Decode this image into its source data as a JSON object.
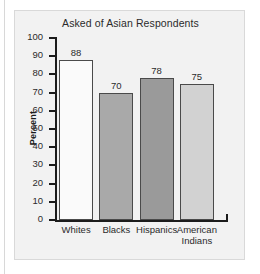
{
  "chart_data": {
    "type": "bar",
    "title": "Asked of Asian Respondents",
    "xlabel": "",
    "ylabel": "Percent",
    "ylim": [
      0,
      100
    ],
    "yticks": [
      0,
      10,
      20,
      30,
      40,
      50,
      60,
      70,
      80,
      90,
      100
    ],
    "grid": false,
    "legend": "none",
    "categories": [
      "Whites",
      "Blacks",
      "Hispanics",
      "American Indians"
    ],
    "category_lines": [
      [
        "Whites"
      ],
      [
        "Blacks"
      ],
      [
        "Hispanics"
      ],
      [
        "American",
        "Indians"
      ]
    ],
    "values": [
      88,
      70,
      78,
      75
    ],
    "value_labels": [
      "88",
      "70",
      "78",
      "75"
    ],
    "bar_colors": [
      "#fafafa",
      "#a9a9a9",
      "#9a9a9a",
      "#d2d2d2"
    ],
    "bar_outline": "#4a4a4a"
  },
  "panel": {
    "background": "#f2f2f2",
    "border": "#d9d9d9"
  },
  "axis": {
    "color": "#1c1c1c",
    "tick_labels": [
      "100",
      "90",
      "80",
      "70",
      "60",
      "50",
      "40",
      "30",
      "20",
      "10",
      "0"
    ]
  }
}
